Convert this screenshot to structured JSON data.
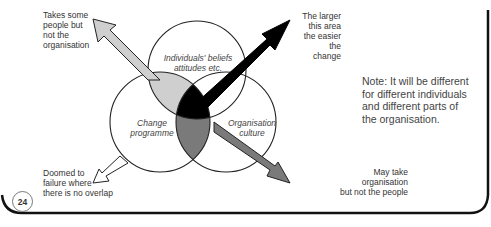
{
  "diagram": {
    "circles": [
      {
        "id": "individuals",
        "label": "Individuals' beliefs\nattitudes etc."
      },
      {
        "id": "change",
        "label": "Change\nprogramme"
      },
      {
        "id": "culture",
        "label": "Organisation\nculture"
      }
    ],
    "annotations": {
      "top_left": "Takes some\npeople but\nnot the\norganisation",
      "top_right": "The larger\nthis area\nthe easier\nthe change",
      "bottom_left": "Doomed to\nfailure where\nthere is no overlap",
      "bottom_right": "May take\norganisation\nbut not the people"
    },
    "note": "Note: It will be different\nfor different individuals\nand different parts of\nthe organisation.",
    "page_number": "24",
    "colors": {
      "light_region": "#cfcfcf",
      "dark_region": "#000000",
      "mid_region": "#7a7a7a",
      "outline": "#222222"
    }
  }
}
